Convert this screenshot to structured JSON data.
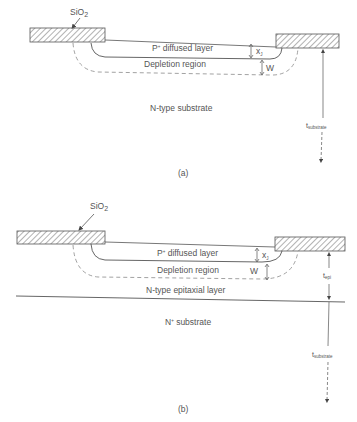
{
  "figure": {
    "panels": [
      {
        "id": "a",
        "caption": "(a)",
        "oxide_label": "SiO",
        "oxide_sub": "2",
        "p_layer_label": "P",
        "p_layer_sup": "+",
        "p_layer_rest": " diffused layer",
        "junction_depth_symbol": "x",
        "junction_depth_sub": "J",
        "depletion_label": "Depletion region",
        "depletion_width_symbol": "W",
        "substrate_label": "N-type substrate",
        "thickness_symbol": "t",
        "thickness_sub": "substrate"
      },
      {
        "id": "b",
        "caption": "(b)",
        "oxide_label": "SiO",
        "oxide_sub": "2",
        "p_layer_label": "P",
        "p_layer_sup": "+",
        "p_layer_rest": " diffused layer",
        "junction_depth_symbol": "x",
        "junction_depth_sub": "J",
        "depletion_label": "Depletion region",
        "depletion_width_symbol": "W",
        "epi_label": "N-type epitaxial layer",
        "epi_thickness_symbol": "t",
        "epi_thickness_sub": "epi",
        "substrate_label": "N",
        "substrate_sup": "+",
        "substrate_rest": " substrate",
        "thickness_symbol": "t",
        "thickness_sub": "substrate"
      }
    ],
    "colors": {
      "line": "#555555",
      "dashed": "#8a8a8a",
      "text": "#555555",
      "background": "#ffffff"
    }
  }
}
